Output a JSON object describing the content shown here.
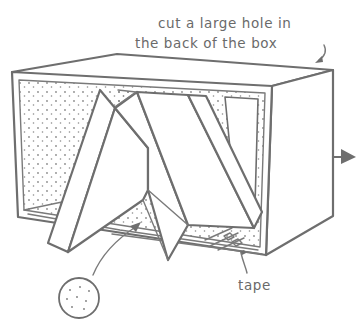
{
  "illustration": {
    "subject": "cardboard box viewer with inner folded panels",
    "annotations": {
      "hole_note_line1": "cut a large hole in",
      "hole_note_line2": "the back of the box",
      "tape_label": "tape"
    },
    "icons": {
      "right_arrow": "arrow-right-icon",
      "dotted_circle": "dotted-circle-icon"
    },
    "colors": {
      "ink": "#6e6e6e",
      "background": "#ffffff"
    }
  }
}
